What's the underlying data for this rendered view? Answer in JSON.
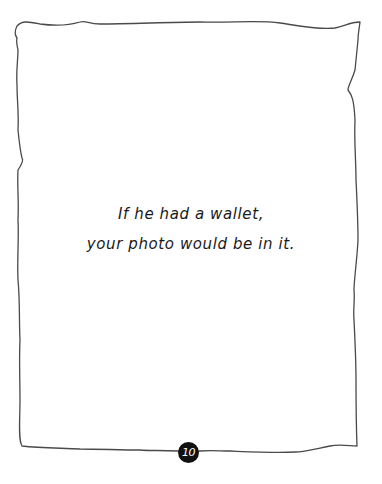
{
  "page": {
    "text_lines": [
      "If he had a wallet,",
      "your photo would be in it."
    ],
    "page_number": "10"
  },
  "colors": {
    "background": "#ffffff",
    "border": "#4a4a4a",
    "text": "#1a1a1a",
    "badge_background": "#111111",
    "badge_text": "#ffffff"
  }
}
